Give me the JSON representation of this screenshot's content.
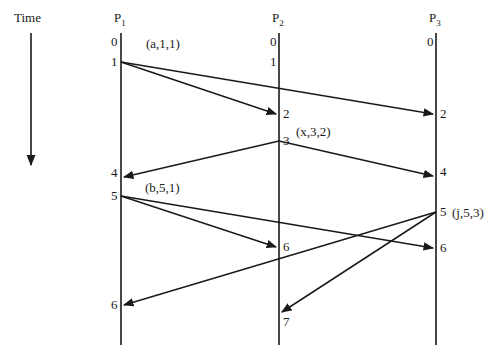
{
  "diagram": {
    "type": "space-time-diagram",
    "time_axis": {
      "label": "Time",
      "x": 31,
      "y_start": 33,
      "y_end": 165
    },
    "processes": [
      {
        "id": "P1",
        "name": "P",
        "sub": "1",
        "x": 121,
        "ticks": [
          {
            "label": "0",
            "y": 42
          },
          {
            "label": "1",
            "y": 62
          },
          {
            "label": "4",
            "y": 173
          },
          {
            "label": "5",
            "y": 196
          },
          {
            "label": "6",
            "y": 305
          }
        ]
      },
      {
        "id": "P2",
        "name": "P",
        "sub": "2",
        "x": 279,
        "ticks": [
          {
            "label": "0",
            "y": 42
          },
          {
            "label": "1",
            "y": 62
          },
          {
            "label": "2",
            "y": 114
          },
          {
            "label": "3",
            "y": 141
          },
          {
            "label": "6",
            "y": 247
          },
          {
            "label": "7",
            "y": 322
          }
        ]
      },
      {
        "id": "P3",
        "name": "P",
        "sub": "3",
        "x": 436,
        "ticks": [
          {
            "label": "0",
            "y": 42
          },
          {
            "label": "2",
            "y": 114
          },
          {
            "label": "4",
            "y": 172
          },
          {
            "label": "5",
            "y": 212
          },
          {
            "label": "6",
            "y": 248
          }
        ]
      }
    ],
    "events": [
      {
        "label": "(a,1,1)",
        "x": 146,
        "y": 48
      },
      {
        "label": "(x,3,2)",
        "x": 296,
        "y": 136
      },
      {
        "label": "(b,5,1)",
        "x": 145,
        "y": 192
      },
      {
        "label": "(j,5,3)",
        "x": 452,
        "y": 217
      }
    ],
    "messages": [
      {
        "from": "P1@1",
        "to": "P2@2",
        "x1": 121,
        "y1": 62,
        "x2": 276,
        "y2": 114
      },
      {
        "from": "P1@1",
        "to": "P3@2",
        "x1": 121,
        "y1": 62,
        "x2": 433,
        "y2": 114
      },
      {
        "from": "P2@3",
        "to": "P1@4",
        "x1": 279,
        "y1": 141,
        "x2": 124,
        "y2": 177
      },
      {
        "from": "P2@3",
        "to": "P3@4",
        "x1": 279,
        "y1": 141,
        "x2": 433,
        "y2": 176
      },
      {
        "from": "P1@5",
        "to": "P2@6",
        "x1": 121,
        "y1": 196,
        "x2": 276,
        "y2": 247
      },
      {
        "from": "P1@5",
        "to": "P3@6",
        "x1": 121,
        "y1": 196,
        "x2": 433,
        "y2": 248
      },
      {
        "from": "P3@5",
        "to": "P1@6",
        "x1": 436,
        "y1": 212,
        "x2": 124,
        "y2": 305
      },
      {
        "from": "P3@5",
        "to": "P2@7",
        "x1": 436,
        "y1": 212,
        "x2": 282,
        "y2": 312
      }
    ]
  }
}
